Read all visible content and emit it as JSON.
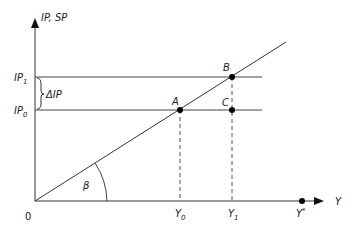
{
  "diagram": {
    "y_axis_label": "IP, SP",
    "x_axis_label": "Y",
    "origin_label": "0",
    "angle_label": "β",
    "delta_label": "ΔIP",
    "y_ticks": [
      {
        "base": "IP",
        "sub": "1"
      },
      {
        "base": "IP",
        "sub": "0"
      }
    ],
    "x_ticks": [
      {
        "base": "Y",
        "sub": "0"
      },
      {
        "base": "Y",
        "sub": "1"
      },
      {
        "base": "Y",
        "sub": "*"
      }
    ],
    "points": [
      {
        "label": "A",
        "x": "Y0",
        "y": "IP0"
      },
      {
        "label": "B",
        "x": "Y1",
        "y": "IP1"
      },
      {
        "label": "C",
        "x": "Y1",
        "y": "IP0"
      }
    ],
    "colors": {
      "line": "#333333",
      "point": "#000000"
    }
  }
}
